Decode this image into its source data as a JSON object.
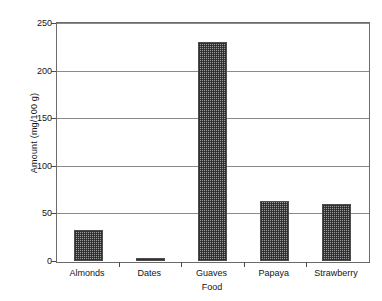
{
  "chart_data": {
    "type": "bar",
    "title": "",
    "xlabel": "Food",
    "ylabel": "Amount (mg/100 g)",
    "categories": [
      "Almonds",
      "Dates",
      "Guaves",
      "Papaya",
      "Strawberry"
    ],
    "values": [
      33,
      3,
      230,
      63,
      60
    ],
    "series": [
      {
        "name": "Amount (mg/100 g)",
        "values": [
          33,
          3,
          230,
          63,
          60
        ]
      }
    ],
    "ylim": [
      0,
      250
    ],
    "ytick_labels": [
      "0",
      "50",
      "100",
      "150",
      "200",
      "250"
    ],
    "ytick_values": [
      0,
      50,
      100,
      150,
      200,
      250
    ],
    "grid": "horizontal",
    "legend": "none",
    "bar_fill": "#9a9a9a",
    "bar_border": "#4d4d4d",
    "axis_color": "#4a4a4a",
    "gridline_color": "#8a8a8a",
    "background": "#ffffff"
  }
}
